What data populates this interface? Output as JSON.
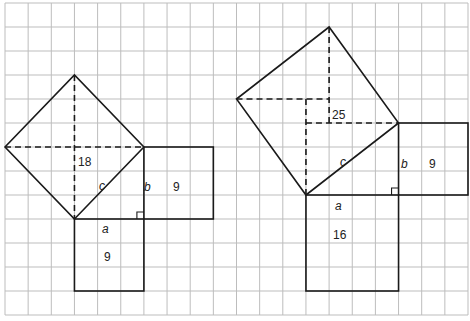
{
  "diagram": {
    "grid": {
      "columns": 20,
      "rows": 13,
      "x0": 5,
      "y0": 3,
      "cell_w": 23.15,
      "cell_h": 24,
      "line_color": "#bdbdbd"
    },
    "stroke_color": "#1a1a1a",
    "figures": [
      {
        "id": "left",
        "triangle": {
          "right_angle": [
            6,
            9
          ],
          "a_end": [
            3,
            9
          ],
          "b_end": [
            6,
            6
          ]
        },
        "square_a": {
          "x": [
            3,
            6
          ],
          "y": [
            9,
            12
          ],
          "area_label": "9"
        },
        "square_b": {
          "x": [
            6,
            9
          ],
          "y": [
            6,
            9
          ],
          "area_label": "9"
        },
        "square_c": {
          "vertices": [
            [
              3,
              9
            ],
            [
              6,
              6
            ],
            [
              3,
              3
            ],
            [
              0,
              6
            ]
          ],
          "area_label": "18"
        },
        "dashed": [
          [
            [
              0,
              6
            ],
            [
              6,
              6
            ]
          ],
          [
            [
              3,
              3
            ],
            [
              3,
              9
            ]
          ]
        ],
        "labels": {
          "a": "a",
          "b": "b",
          "c": "c",
          "area_a": "9",
          "area_b": "9",
          "area_c": "18"
        }
      },
      {
        "id": "right",
        "triangle": {
          "right_angle": [
            17,
            8
          ],
          "a_end": [
            13,
            8
          ],
          "b_end": [
            17,
            5
          ]
        },
        "square_a": {
          "x": [
            13,
            17
          ],
          "y": [
            8,
            12
          ],
          "area_label": "16"
        },
        "square_b": {
          "x": [
            17,
            20
          ],
          "y": [
            5,
            8
          ],
          "area_label": "9"
        },
        "square_c": {
          "vertices": [
            [
              13,
              8
            ],
            [
              17,
              5
            ],
            [
              14,
              1
            ],
            [
              10,
              4
            ]
          ],
          "area_label": "25"
        },
        "dashed": [
          [
            [
              14,
              1
            ],
            [
              14,
              5
            ]
          ],
          [
            [
              13,
              5
            ],
            [
              17,
              5
            ]
          ],
          [
            [
              13,
              4
            ],
            [
              13,
              8
            ]
          ],
          [
            [
              10,
              4
            ],
            [
              14,
              4
            ]
          ]
        ],
        "labels": {
          "a": "a",
          "b": "b",
          "c": "c",
          "area_a": "16",
          "area_b": "9",
          "area_c": "25"
        }
      }
    ]
  }
}
